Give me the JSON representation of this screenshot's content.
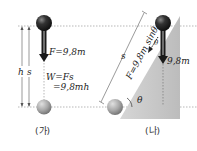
{
  "panel_a": {
    "caption": "(가)",
    "height_label": "h",
    "distance_label": "s",
    "force_label": "F=9,8m",
    "work_label_line1": "W=Fs",
    "work_label_line2": "=9,8mh"
  },
  "panel_b": {
    "caption": "(나)",
    "distance_label": "s",
    "force_label": "F=9,8m sinθ",
    "weight_label": "9,8m",
    "angle_label": "θ",
    "angle_label_top": "θ"
  },
  "colors": {
    "ball_dark": "#2a2a2a",
    "ball_light": "#9a9a9a",
    "incline": "#c8c8c8",
    "arrow": "#1a1a1a"
  }
}
